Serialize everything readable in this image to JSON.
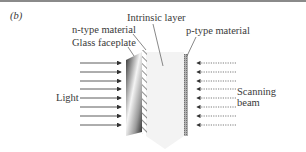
{
  "figure": {
    "panel_label": "(b)",
    "labels": {
      "intrinsic_layer": "Intrinsic layer",
      "n_type": "n-type material",
      "glass_faceplate": "Glass faceplate",
      "p_type": "p-type material",
      "light": "Light",
      "scanning": "Scanning",
      "beam": "beam"
    },
    "arrow_rows": [
      63,
      72,
      81,
      89,
      98,
      107,
      116,
      125
    ],
    "colors": {
      "rule": "#8a8a8a",
      "text": "#3a3a3a",
      "glass_dark": "#3c3c3c",
      "glass_light": "#f2f2f2",
      "intrinsic": "#f3f3f3",
      "p_type": "#9a9a9a",
      "arrow": "#333333"
    }
  }
}
